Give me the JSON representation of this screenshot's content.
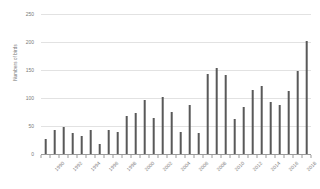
{
  "chart_data": {
    "type": "bar",
    "title": "",
    "xlabel": "",
    "ylabel": "Numbers of birds",
    "ylim": [
      0,
      250
    ],
    "yticks": [
      0,
      50,
      100,
      150,
      200,
      250
    ],
    "grid": true,
    "legend": "none",
    "bar_color": "#595959",
    "gridline_color": "#e2e2e2",
    "axis_color": "#9a9a9a",
    "tick_label_color": "#7a7a7a",
    "xtick_label_rotation": -45,
    "xtick_label_interval": 2,
    "categories": [
      "1990",
      "1991",
      "1992",
      "1993",
      "1994",
      "1995",
      "1996",
      "1997",
      "1998",
      "1999",
      "2000",
      "2001",
      "2002",
      "2003",
      "2004",
      "2005",
      "2006",
      "2007",
      "2008",
      "2009",
      "2010",
      "2011",
      "2012",
      "2013",
      "2014",
      "2015",
      "2016",
      "2017",
      "2018",
      "2019"
    ],
    "xtick_labels": [
      "1990",
      "1992",
      "1994",
      "1996",
      "1998",
      "2000",
      "2002",
      "2004",
      "2006",
      "2008",
      "2010",
      "2012",
      "2014",
      "2016",
      "2018"
    ],
    "values": [
      26,
      43,
      49,
      37,
      32,
      42,
      18,
      42,
      40,
      67,
      74,
      96,
      65,
      102,
      75,
      40,
      87,
      38,
      142,
      153,
      141,
      62,
      84,
      115,
      121,
      93,
      87,
      112,
      149,
      201
    ]
  }
}
